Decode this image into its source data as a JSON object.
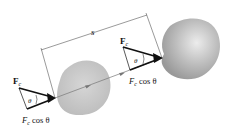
{
  "diagram": {
    "displacement_label": "s",
    "initial_position": {
      "force_label": "F",
      "force_subscript": "c",
      "angle_label": "θ",
      "component_label": "F",
      "component_subscript": "c",
      "component_suffix": " cos θ"
    },
    "final_position": {
      "force_label": "F",
      "force_subscript": "c",
      "angle_label": "θ",
      "component_label": "F",
      "component_subscript": "c",
      "component_suffix": " cos θ"
    },
    "colors": {
      "body_fill": "#c8c8c8",
      "arrow": "#111111",
      "dimension_line": "#555555",
      "path_line": "#777777"
    }
  }
}
